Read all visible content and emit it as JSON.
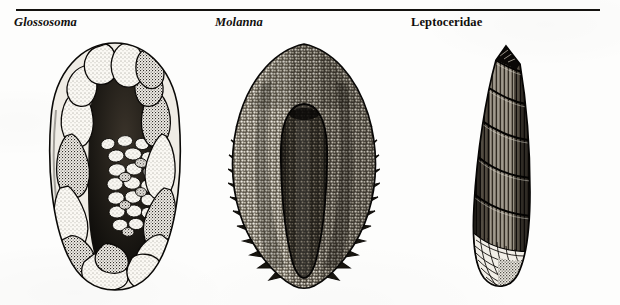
{
  "plate": {
    "width": 620,
    "height": 305,
    "background_color": "#fdfdfc",
    "ink_color": "#14120f",
    "rule": {
      "present": true,
      "color": "#14120f"
    }
  },
  "figures": [
    {
      "id": "glossosoma",
      "label": "Glossosoma",
      "label_style": "bold-italic",
      "caption_kind": "genus",
      "icon": "caddisfly-case-pebble-dome",
      "description": "Dome-shaped saddle case built of coarse pebbles"
    },
    {
      "id": "molanna",
      "label": "Molanna",
      "label_style": "bold-italic",
      "caption_kind": "genus",
      "icon": "caddisfly-case-sand-shield",
      "description": "Flat shield-shaped case of fine sand grains with a central tube"
    },
    {
      "id": "leptoceridae",
      "label": "Leptoceridae",
      "label_style": "bold-upright",
      "caption_kind": "family",
      "icon": "caddisfly-case-tapered-tube",
      "description": "Slender tapering tube case of spirally arranged plant fragments"
    }
  ]
}
